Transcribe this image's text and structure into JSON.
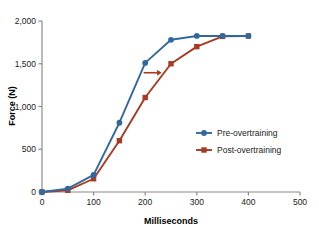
{
  "chart_data": {
    "type": "line",
    "title": "",
    "xlabel": "Milliseconds",
    "ylabel": "Force (N)",
    "xlim": [
      0,
      500
    ],
    "ylim": [
      0,
      2000
    ],
    "x_ticks": [
      0,
      100,
      200,
      300,
      400,
      500
    ],
    "x_tick_labels": [
      "0",
      "100",
      "200",
      "300",
      "400",
      "500"
    ],
    "y_ticks": [
      0,
      500,
      1000,
      1500,
      2000
    ],
    "y_tick_labels": [
      "0",
      "500",
      "1,000",
      "1,500",
      "2,000"
    ],
    "grid": false,
    "legend_position": "center-right",
    "x": [
      0,
      50,
      100,
      150,
      200,
      250,
      300,
      350,
      400
    ],
    "series": [
      {
        "name": "Pre-overtraining",
        "color": "#31699E",
        "marker": "circle",
        "values": [
          0,
          40,
          200,
          810,
          1510,
          1780,
          1825,
          1825,
          1825
        ]
      },
      {
        "name": "Post-overtraining",
        "color": "#A63A23",
        "marker": "square",
        "values": [
          0,
          20,
          155,
          600,
          1105,
          1500,
          1700,
          1820,
          1825
        ]
      }
    ],
    "annotations": [
      {
        "type": "arrow",
        "name": "rightward-shift-arrow",
        "color": "#A63A23",
        "x_start": 197,
        "x_end": 232,
        "y": 1395,
        "direction": "right"
      }
    ]
  },
  "axes": {
    "axis_color": "#8a8a8a",
    "tick_color": "#8a8a8a"
  },
  "legend": {
    "entries": [
      {
        "label": "Pre-overtraining"
      },
      {
        "label": "Post-overtraining"
      }
    ]
  }
}
